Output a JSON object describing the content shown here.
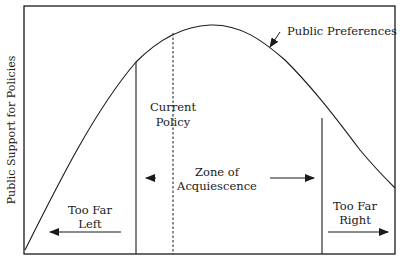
{
  "diagram": {
    "y_axis_label": "Public Support for Policies",
    "curve_label": "Public Preferences",
    "current_policy": {
      "line1": "Current",
      "line2": "Policy"
    },
    "zone": {
      "line1": "Zone of",
      "line2": "Acquiescence"
    },
    "too_far_left": {
      "line1": "Too Far",
      "line2": "Left"
    },
    "too_far_right": {
      "line1": "Too Far",
      "line2": "Right"
    },
    "colors": {
      "ink": "#1a1a1a",
      "background": "#ffffff"
    }
  }
}
